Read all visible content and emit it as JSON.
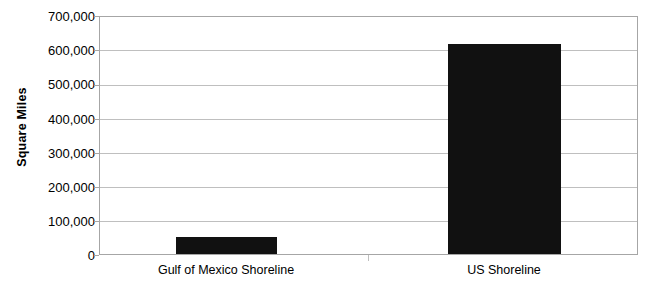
{
  "chart_data": {
    "type": "bar",
    "title": "",
    "xlabel": "",
    "ylabel": "Square Miles",
    "categories": [
      "Gulf of Mexico Shoreline",
      "US Shoreline"
    ],
    "values": [
      50000,
      620000
    ],
    "ylim": [
      0,
      700000
    ],
    "ytick_values": [
      0,
      100000,
      200000,
      300000,
      400000,
      500000,
      600000,
      700000
    ],
    "ytick_labels": [
      "0",
      "100,000",
      "200,000",
      "300,000",
      "400,000",
      "500,000",
      "600,000",
      "700,000"
    ],
    "grid": true,
    "legend": false,
    "bar_color": "#111111",
    "gridline_color": "#bfbfbf",
    "axis_color": "#a6a6a6"
  }
}
